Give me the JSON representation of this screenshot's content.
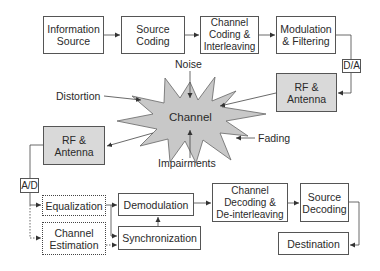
{
  "diagram": {
    "type": "communication-system-block-diagram",
    "transmitter": {
      "blocks": [
        {
          "id": "info_source",
          "label": "Information\nSource"
        },
        {
          "id": "source_coding",
          "label": "Source\nCoding"
        },
        {
          "id": "channel_coding",
          "label": "Channel\nCoding &\nInterleaving"
        },
        {
          "id": "modulation",
          "label": "Modulation\n& Filtering"
        },
        {
          "id": "da",
          "label": "D/A"
        },
        {
          "id": "rf_tx",
          "label": "RF &\nAntenna"
        }
      ]
    },
    "channel": {
      "label": "Channel",
      "impairments": {
        "noise": "Noise",
        "distortion": "Distortion",
        "fading": "Fading",
        "impairments": "Impairments"
      },
      "fill_color": "#c8c8c8"
    },
    "receiver": {
      "blocks": [
        {
          "id": "rf_rx",
          "label": "RF &\nAntenna"
        },
        {
          "id": "ad",
          "label": "A/D"
        },
        {
          "id": "equalization",
          "label": "Equalization"
        },
        {
          "id": "channel_estimation",
          "label": "Channel\nEstimation"
        },
        {
          "id": "demodulation",
          "label": "Demodulation"
        },
        {
          "id": "synchronization",
          "label": "Synchronization"
        },
        {
          "id": "channel_decoding",
          "label": "Channel\nDecoding &\nDe-interleaving"
        },
        {
          "id": "source_decoding",
          "label": "Source\nDecoding"
        },
        {
          "id": "destination",
          "label": "Destination"
        }
      ]
    },
    "colors": {
      "box_border": "#555555",
      "shaded_box": "#d9d9d9",
      "line": "#444444"
    }
  }
}
